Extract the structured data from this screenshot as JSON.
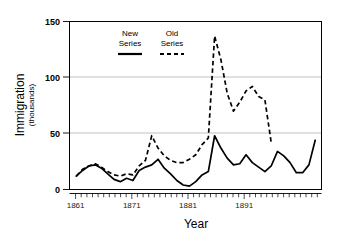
{
  "chart_data": {
    "type": "line",
    "title": "",
    "xlabel": "Year",
    "ylabel": "Immigration",
    "ylabel_sub": "(thousands)",
    "xlim": [
      1860,
      1900
    ],
    "ylim": [
      0,
      150
    ],
    "grid": "horizontal gridlines at 50 and 100",
    "legend_position": "inside top-center-left",
    "ytick_labels": [
      "0",
      "50",
      "100",
      "150"
    ],
    "ytick_values": [
      0,
      50,
      100,
      150
    ],
    "xtick_labels": [
      "1861",
      "1871",
      "1881",
      "1891"
    ],
    "xtick_values": [
      1861,
      1871,
      1881,
      1891
    ],
    "minor_xticks": "every year from 1861 to 1899",
    "series": [
      {
        "name": "New Series",
        "style": "solid",
        "color": "#000000",
        "x": [
          1861,
          1862,
          1863,
          1864,
          1865,
          1866,
          1867,
          1868,
          1869,
          1870,
          1871,
          1872,
          1873,
          1874,
          1875,
          1876,
          1877,
          1878,
          1879,
          1880,
          1881,
          1882,
          1883,
          1884,
          1885,
          1886,
          1887,
          1888,
          1889,
          1890,
          1891,
          1892,
          1893,
          1894,
          1895,
          1896,
          1897,
          1898,
          1899
        ],
        "values": [
          12,
          17,
          21,
          22,
          19,
          14,
          9,
          7,
          10,
          8,
          17,
          20,
          22,
          27,
          19,
          14,
          8,
          4,
          3,
          7,
          13,
          16,
          48,
          37,
          28,
          22,
          23,
          31,
          24,
          20,
          16,
          21,
          34,
          30,
          24,
          15,
          15,
          22,
          44
        ]
      },
      {
        "name": "Old Series",
        "style": "dashed",
        "color": "#000000",
        "x": [
          1861,
          1862,
          1863,
          1864,
          1865,
          1866,
          1867,
          1868,
          1869,
          1870,
          1871,
          1872,
          1873,
          1874,
          1875,
          1876,
          1877,
          1878,
          1879,
          1880,
          1881,
          1882,
          1883,
          1884,
          1885,
          1886,
          1887,
          1888,
          1889,
          1890,
          1891,
          1892
        ],
        "values": [
          12,
          18,
          21,
          23,
          20,
          16,
          13,
          12,
          14,
          13,
          21,
          26,
          48,
          37,
          30,
          26,
          24,
          24,
          27,
          31,
          40,
          46,
          137,
          116,
          86,
          70,
          78,
          88,
          92,
          83,
          80,
          42
        ]
      }
    ],
    "legend": [
      {
        "label_line1": "New",
        "label_line2": "Series",
        "style": "solid"
      },
      {
        "label_line1": "Old",
        "label_line2": "Series",
        "style": "dashed"
      }
    ]
  }
}
